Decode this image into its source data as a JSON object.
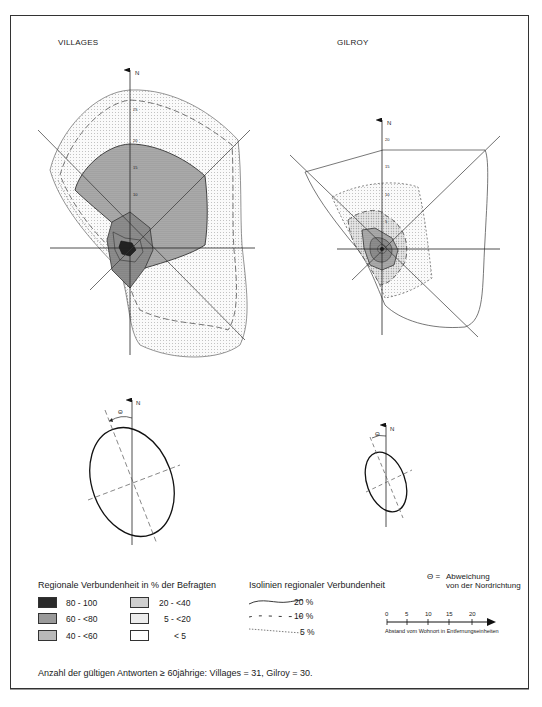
{
  "diagrams": {
    "villages": {
      "title": "VILLAGES",
      "axis_label": "N",
      "axis_ticks": [
        "25",
        "20",
        "15",
        "10",
        "5"
      ]
    },
    "gilroy": {
      "title": "GILROY",
      "axis_label": "N",
      "axis_ticks": [
        "20",
        "15",
        "10",
        "5"
      ]
    }
  },
  "ellipses": {
    "villages": {
      "axis_label": "N",
      "angle_symbol": "Θ"
    },
    "gilroy": {
      "axis_label": "N",
      "angle_symbol": "Θ"
    }
  },
  "legend": {
    "shading": {
      "title": "Regionale Verbundenheit in % der Befragten",
      "items": [
        {
          "label": "80 - 100",
          "fill": "#2a2a2a"
        },
        {
          "label": "60 - <80",
          "fill": "#9a9a9a"
        },
        {
          "label": "40 - <60",
          "fill": "#b8b8b8"
        },
        {
          "label": "20 - <40",
          "fill": "#cfcfcf"
        },
        {
          "label": "5 - <20",
          "fill": "#ececec"
        },
        {
          "label": "< 5",
          "fill": "#ffffff"
        }
      ]
    },
    "isolines": {
      "title": "Isolinien regionaler Verbundenheit",
      "items": [
        {
          "label": "20 %",
          "style": "solid"
        },
        {
          "label": "10 %",
          "style": "dashed"
        },
        {
          "label": "5 %",
          "style": "dotted"
        }
      ]
    },
    "theta": {
      "symbol": "Θ =",
      "line1": "Abweichung",
      "line2": "von der Nordrichtung"
    },
    "scale": {
      "ticks": [
        "0",
        "5",
        "10",
        "15",
        "20"
      ],
      "caption": "Abstand vom Wohnort in Entfernungseinheiten"
    }
  },
  "footnote": "Anzahl der gültigen Antworten ≥ 60jährige: Villages = 31, Gilroy = 30."
}
